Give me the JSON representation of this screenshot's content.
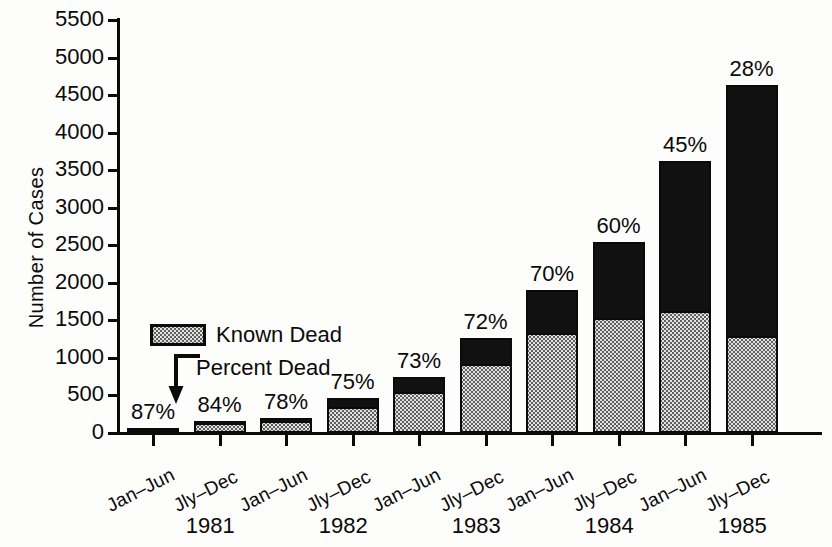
{
  "chart_data": {
    "type": "bar",
    "title": "",
    "xlabel": "",
    "ylabel": "Number of Cases",
    "ylim": [
      0,
      5500
    ],
    "ytick_step": 500,
    "yticks": [
      "5500",
      "5000",
      "4500",
      "4000",
      "3500",
      "3000",
      "2500",
      "2000",
      "1500",
      "1000",
      "500",
      "0"
    ],
    "grid": false,
    "stacked": true,
    "legend_position": "inside-left",
    "categories": [
      "Jan–Jun",
      "Jly–Dec",
      "Jan–Jun",
      "Jly–Dec",
      "Jan–Jun",
      "Jly–Dec",
      "Jan–Jun",
      "Jly–Dec",
      "Jan–Jun",
      "Jly–Dec"
    ],
    "group_labels": [
      "1981",
      "1982",
      "1983",
      "1984",
      "1985"
    ],
    "series": [
      {
        "name": "Known Dead",
        "values": [
          52,
          134,
          156,
          345,
          540,
          914,
          1330,
          1530,
          1629,
          1296
        ]
      },
      {
        "name": "Alive (remainder)",
        "values": [
          8,
          26,
          44,
          115,
          200,
          356,
          570,
          1020,
          1991,
          3334
        ]
      }
    ],
    "totals": [
      60,
      160,
      200,
      460,
      740,
      1270,
      1900,
      2550,
      3620,
      4630
    ],
    "annotations": [
      "87%",
      "84%",
      "78%",
      "75%",
      "73%",
      "72%",
      "70%",
      "60%",
      "45%",
      "28%"
    ],
    "annotation_meaning": "Percent Dead"
  },
  "legend": {
    "known_dead": "Known Dead",
    "percent_dead": "Percent Dead"
  },
  "axis": {
    "ylabel": "Number of Cases"
  },
  "colors": {
    "dead": "#111111",
    "known_dead_fill": "#e2e2e2",
    "outline": "#0a0a0a",
    "background": "#fdfdfb"
  }
}
